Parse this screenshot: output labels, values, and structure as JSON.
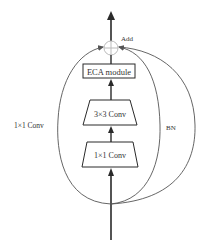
{
  "diagram": {
    "type": "residual-block",
    "colors": {
      "stroke": "#2a2a2a",
      "loop_stroke": "#555555",
      "add_circle": "#bbbbbb",
      "text": "#333333",
      "background": "#ffffff"
    },
    "nodes": {
      "add": {
        "label": "Add",
        "symbol": "⊕"
      },
      "eca": {
        "label": "ECA module"
      },
      "conv3": {
        "label": "3×3 Conv"
      },
      "conv1": {
        "label": "1×1 Conv"
      }
    },
    "branches": {
      "left": {
        "label": "1×1 Conv"
      },
      "right": {
        "label": "BN"
      }
    }
  }
}
